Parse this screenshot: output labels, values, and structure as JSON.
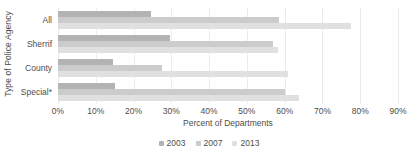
{
  "chart_data": {
    "type": "bar",
    "orientation": "horizontal",
    "title": "",
    "xlabel": "Percent of Departments",
    "ylabel": "Type of Police Agency",
    "categories": [
      "All",
      "Sherrif",
      "County",
      "Special*"
    ],
    "series": [
      {
        "name": "2003",
        "color": "#b3b3b3",
        "values": [
          24.6,
          29.7,
          14.6,
          15.0
        ]
      },
      {
        "name": "2007",
        "color": "#cccccc",
        "values": [
          58.4,
          56.9,
          27.6,
          60.2
        ]
      },
      {
        "name": "2013",
        "color": "#e0e0e0",
        "values": [
          77.5,
          58.2,
          60.8,
          63.8
        ]
      }
    ],
    "xlim": [
      0,
      90
    ],
    "xticks": [
      0,
      10,
      20,
      30,
      40,
      50,
      60,
      70,
      80,
      90
    ],
    "xticklabels": [
      "0%",
      "10%",
      "20%",
      "30%",
      "40%",
      "50%",
      "60%",
      "70%",
      "80%",
      "90%"
    ],
    "grid": true,
    "grid_axis": "x",
    "grid_color": "#ebebeb",
    "legend": {
      "position": "bottom",
      "entries": [
        "2003",
        "2007",
        "2013"
      ]
    },
    "background": "#ffffff",
    "text_color": "#4d4d4d"
  }
}
